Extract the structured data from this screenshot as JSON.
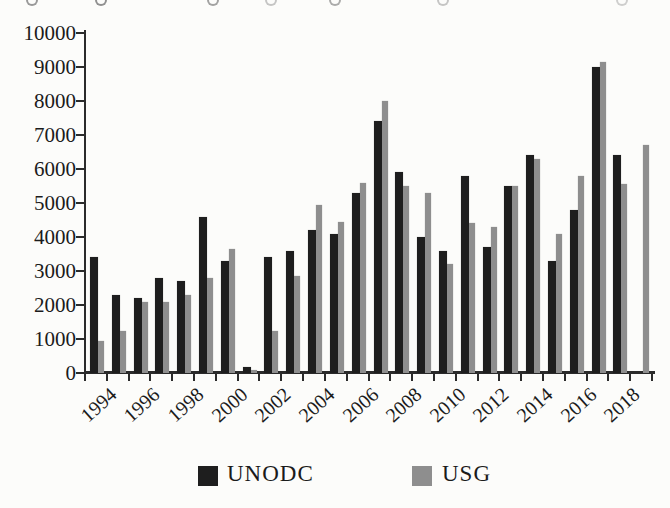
{
  "figure": {
    "background": "#fcfcfa",
    "axis_color": "#2b2b2b",
    "text_color": "#1b1b1b"
  },
  "chart_data": {
    "type": "bar",
    "title": "",
    "xlabel": "",
    "ylabel": "",
    "categories": [
      1994,
      1995,
      1996,
      1997,
      1998,
      1999,
      2000,
      2001,
      2002,
      2003,
      2004,
      2005,
      2006,
      2007,
      2008,
      2009,
      2010,
      2011,
      2012,
      2013,
      2014,
      2015,
      2016,
      2017,
      2018,
      2019
    ],
    "series": [
      {
        "name": "UNODC",
        "color": "#1e1e1e",
        "values": [
          3400,
          2300,
          2200,
          2800,
          2700,
          4600,
          3300,
          185,
          3400,
          3600,
          4200,
          4100,
          5300,
          7400,
          5900,
          4000,
          3600,
          5800,
          3700,
          5500,
          6400,
          3300,
          4800,
          9000,
          6400,
          null
        ]
      },
      {
        "name": "USG",
        "color": "#8e8e8e",
        "values": [
          950,
          1250,
          2100,
          2100,
          2300,
          2800,
          3650,
          75,
          1250,
          2850,
          4950,
          4450,
          5600,
          8000,
          5500,
          5300,
          3200,
          4400,
          4300,
          5500,
          6300,
          4100,
          5800,
          9140,
          5550,
          6700
        ]
      }
    ],
    "ylim": [
      0,
      10000
    ],
    "ytick_step": 1000,
    "ytick_labels": [
      "0",
      "1000",
      "2000",
      "3000",
      "4000",
      "5000",
      "6000",
      "7000",
      "8000",
      "9000",
      "10000"
    ],
    "xtick_labels": [
      "1994",
      "1996",
      "1998",
      "2000",
      "2002",
      "2004",
      "2006",
      "2008",
      "2010",
      "2012",
      "2014",
      "2016",
      "2018"
    ],
    "grid": false,
    "legend_position": "bottom"
  }
}
